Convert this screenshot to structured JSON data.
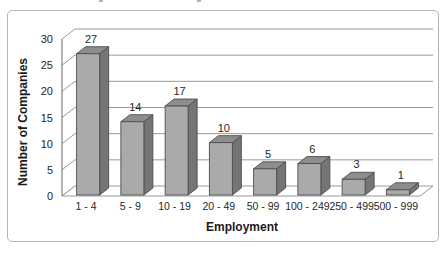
{
  "chart_data": {
    "type": "bar",
    "projection": "3d-column",
    "title": "",
    "xlabel": "Employment",
    "ylabel": "Number of Companies",
    "categories": [
      "1 - 4",
      "5 - 9",
      "10 - 19",
      "20 - 49",
      "50 - 99",
      "100 - 249",
      "250 - 499",
      "500 - 999"
    ],
    "values": [
      27,
      14,
      17,
      10,
      5,
      6,
      3,
      1
    ],
    "value_labels": [
      "27",
      "14",
      "17",
      "10",
      "5",
      "6",
      "3",
      "1"
    ],
    "yticks": [
      0,
      5,
      10,
      15,
      20,
      25,
      30
    ],
    "ylim": [
      0,
      30
    ],
    "grid": true,
    "legend": false,
    "colors": {
      "bar_front": "#aaaaaa",
      "bar_top": "#8d8d8d",
      "bar_side": "#757575",
      "bar_outline": "#4d4d4d",
      "gridline": "#999999",
      "axis": "#808080",
      "text": "#262626",
      "frame_border": "#b5b5b5",
      "background": "#ffffff"
    }
  }
}
